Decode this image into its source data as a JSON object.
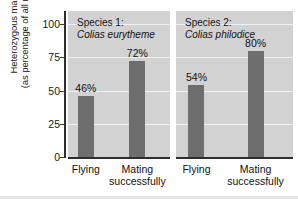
{
  "chart_data": {
    "type": "bar",
    "title": "",
    "xlabel": "",
    "ylabel_line1": "Heterozygous males",
    "ylabel_line2": "(as percentage of all males)",
    "ylim": [
      0,
      110
    ],
    "yticks": [
      0,
      25,
      50,
      75,
      100
    ],
    "ytick_labels": [
      "0",
      "25",
      "50",
      "75",
      "100"
    ],
    "grid": true,
    "legend": "none",
    "categories": [
      "Flying",
      "Mating successfully"
    ],
    "panels": [
      {
        "panel_label": "Species 1:",
        "species_name": "Colias eurytheme",
        "values": [
          46,
          72
        ],
        "value_labels": [
          "46%",
          "72%"
        ],
        "category_labels": [
          {
            "line1": "Flying",
            "line2": ""
          },
          {
            "line1": "Mating",
            "line2": "successfully"
          }
        ]
      },
      {
        "panel_label": "Species 2:",
        "species_name": "Colias philodice",
        "values": [
          54,
          80
        ],
        "value_labels": [
          "54%",
          "80%"
        ],
        "category_labels": [
          {
            "line1": "Flying",
            "line2": ""
          },
          {
            "line1": "Mating",
            "line2": "successfully"
          }
        ]
      }
    ],
    "colors": {
      "bar": "#6e6e6e",
      "panel_background": "#d2d2d2",
      "gridline": "#f2f2f2",
      "axis": "#2e2e2e",
      "text": "#111111",
      "page_background": "#ffffff"
    }
  }
}
